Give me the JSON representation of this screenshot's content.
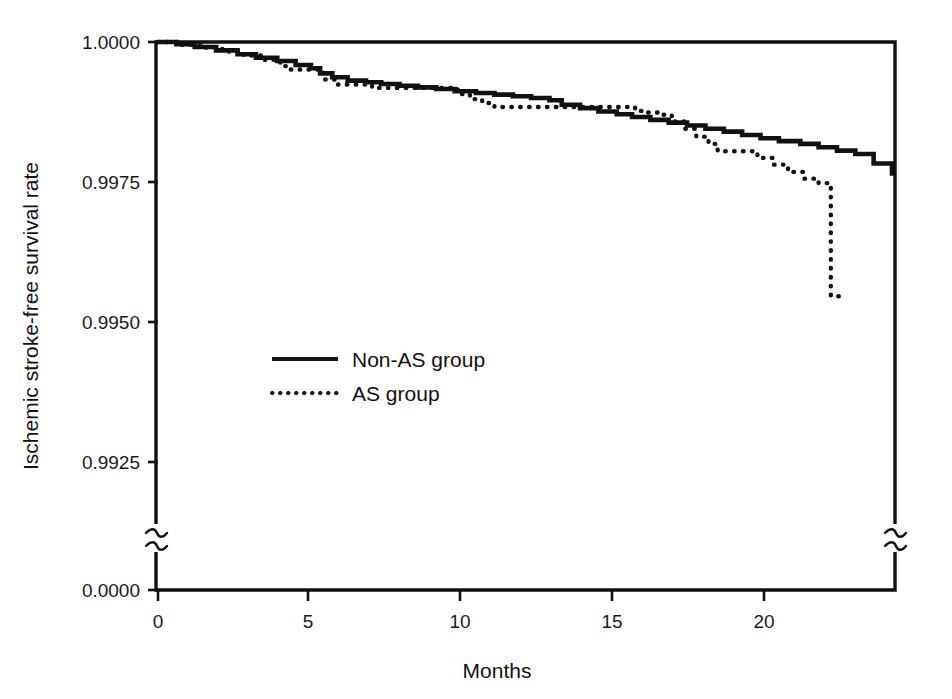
{
  "chart_data": {
    "type": "line",
    "subtype": "kaplan-meier-step",
    "title": "",
    "xlabel": "Months",
    "ylabel": "Ischemic stroke-free survival rate",
    "xlim": [
      0,
      24
    ],
    "ylim": [
      0.99,
      1.0
    ],
    "grid": false,
    "legend_position": "center-left",
    "y_axis_break": true,
    "y_axis_break_note": "axis broken between 0.9925 and 0.0000",
    "xticks": [
      0,
      5,
      10,
      15,
      20
    ],
    "xticklabels": [
      "0",
      "5",
      "10",
      "15",
      "20"
    ],
    "yticks": [
      1.0,
      0.9975,
      0.995,
      0.9925,
      0.0
    ],
    "yticklabels": [
      "1.0000",
      "0.9975",
      "0.9950",
      "0.9925",
      "0.0000"
    ],
    "series": [
      {
        "name": "Non-AS group",
        "style": "solid",
        "color": "#111111",
        "x": [
          0.0,
          0.6,
          1.2,
          1.9,
          2.6,
          3.2,
          3.9,
          4.5,
          5.0,
          5.3,
          5.7,
          6.2,
          6.8,
          7.3,
          7.9,
          8.5,
          9.1,
          9.7,
          10.4,
          11.0,
          11.6,
          12.2,
          12.8,
          13.2,
          13.8,
          14.4,
          15.0,
          15.5,
          16.1,
          16.7,
          17.3,
          17.9,
          18.5,
          19.1,
          19.7,
          20.3,
          21.0,
          21.6,
          22.2,
          22.8,
          23.4,
          24.0
        ],
        "y": [
          1.0,
          0.99996,
          0.99991,
          0.99985,
          0.99978,
          0.99972,
          0.99966,
          0.99959,
          0.99953,
          0.99944,
          0.99937,
          0.99931,
          0.99928,
          0.99925,
          0.99922,
          0.99919,
          0.99916,
          0.99912,
          0.99909,
          0.99906,
          0.99903,
          0.999,
          0.99896,
          0.99888,
          0.99882,
          0.99876,
          0.99871,
          0.99866,
          0.99861,
          0.99856,
          0.99851,
          0.99845,
          0.9984,
          0.99834,
          0.99828,
          0.99823,
          0.99818,
          0.99812,
          0.99806,
          0.998,
          0.99783,
          0.99761
        ]
      },
      {
        "name": "AS group",
        "style": "dotted",
        "color": "#111111",
        "x": [
          0.0,
          0.7,
          1.4,
          2.1,
          2.8,
          3.5,
          4.0,
          4.3,
          4.7,
          5.0,
          5.4,
          5.8,
          6.2,
          6.6,
          7.0,
          7.4,
          7.8,
          8.2,
          8.6,
          9.0,
          9.4,
          9.8,
          10.2,
          10.6,
          11.0,
          11.4,
          11.8,
          12.4,
          13.0,
          13.6,
          14.2,
          14.8,
          15.3,
          15.6,
          16.0,
          16.4,
          16.8,
          17.2,
          17.6,
          18.0,
          18.3,
          18.7,
          19.1,
          19.6,
          20.1,
          20.6,
          21.1,
          21.6,
          22.0,
          22.3
        ],
        "y": [
          1.0,
          0.99995,
          0.9999,
          0.99983,
          0.99976,
          0.99968,
          0.99957,
          0.99951,
          0.99951,
          0.99951,
          0.99933,
          0.99924,
          0.99924,
          0.99924,
          0.99918,
          0.99918,
          0.99918,
          0.99918,
          0.99918,
          0.99918,
          0.99918,
          0.99907,
          0.99898,
          0.99891,
          0.99884,
          0.99884,
          0.99884,
          0.99884,
          0.99884,
          0.99884,
          0.99884,
          0.99884,
          0.99884,
          0.99877,
          0.99874,
          0.9987,
          0.99858,
          0.99845,
          0.99831,
          0.99818,
          0.99805,
          0.99805,
          0.99805,
          0.99793,
          0.99781,
          0.99768,
          0.99756,
          0.99748,
          0.99546,
          0.99546
        ]
      }
    ]
  },
  "legend": {
    "items": [
      {
        "label": "Non-AS group",
        "style": "solid"
      },
      {
        "label": "AS group",
        "style": "dotted"
      }
    ]
  },
  "ghost_title": ""
}
